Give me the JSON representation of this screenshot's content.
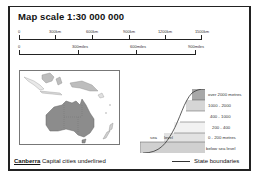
{
  "title": "Map scale  1:30 000 000",
  "scale_km": {
    "labels": [
      "0",
      "300km",
      "600km",
      "900km",
      "1200km",
      "1500km"
    ]
  },
  "scale_miles": {
    "labels": [
      "0",
      "300miles",
      "600miles",
      "900miles"
    ]
  },
  "elevation_key": {
    "levels": [
      "over 2000 metres",
      "1000 - 2000",
      "400 - 1000",
      "200 - 400",
      "0 - 200 metres",
      "below sea level"
    ],
    "sea_label": "sea",
    "level_label": "level",
    "colors": [
      "#a8a8a8",
      "#d6d6d6",
      "#ffffff",
      "#f2f2f2",
      "#e2e2e2",
      "#d0d0d0"
    ]
  },
  "map": {
    "land_color": "#8c8c8c",
    "region": "Australasia"
  },
  "footer": {
    "capital_example": "Canberra",
    "capital_text": " Capital cities underlined",
    "state_boundaries": "State boundaries"
  }
}
